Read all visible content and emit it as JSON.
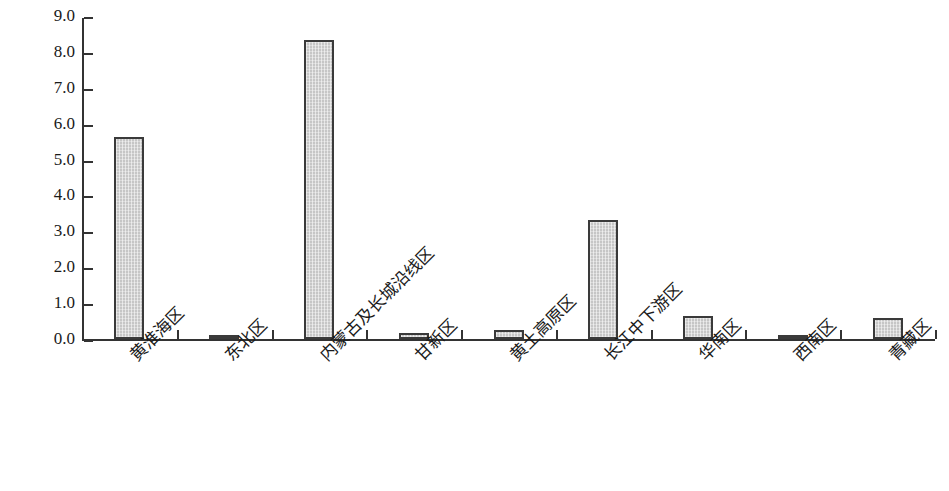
{
  "chart_data": {
    "type": "bar",
    "title": "",
    "xlabel": "",
    "ylabel": "面积(万hm2)",
    "ylabel_parts": {
      "prefix": "面积(万hm",
      "sup": "2",
      "suffix": ")"
    },
    "categories": [
      "黄淮海区",
      "东北区",
      "内蒙古及长城沿线区",
      "甘新区",
      "黄土高原区",
      "长江中下游区",
      "华南区",
      "西南区",
      "青藏区"
    ],
    "values": [
      5.62,
      0.08,
      8.33,
      0.17,
      0.24,
      3.31,
      0.63,
      0.1,
      0.59
    ],
    "ylim": [
      0.0,
      9.0
    ],
    "ytick_labels": [
      "0.0",
      "1.0",
      "2.0",
      "3.0",
      "4.0",
      "5.0",
      "6.0",
      "7.0",
      "8.0",
      "9.0"
    ],
    "ytick_values": [
      0.0,
      1.0,
      2.0,
      3.0,
      4.0,
      5.0,
      6.0,
      7.0,
      8.0,
      9.0
    ],
    "grid": false,
    "legend": null,
    "bar_fill_color": "#c6c6c6",
    "bar_edge_color": "#3a3a3a",
    "axis_color": "#333333",
    "background_color": "#ffffff"
  }
}
